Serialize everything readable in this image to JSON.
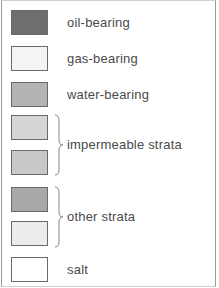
{
  "legend": {
    "items": [
      {
        "label": "oil-bearing",
        "color": "#6e6e6e"
      },
      {
        "label": "gas-bearing",
        "color": "#f4f4f4"
      },
      {
        "label": "water-bearing",
        "color": "#b4b4b4"
      }
    ],
    "groups": [
      {
        "label": "impermeable strata",
        "colors": [
          "#d6d6d6",
          "#c8c8c8"
        ]
      },
      {
        "label": "other strata",
        "colors": [
          "#a8a8a8",
          "#ececec"
        ]
      }
    ],
    "salt": {
      "label": "salt",
      "color": "#ffffff"
    }
  }
}
